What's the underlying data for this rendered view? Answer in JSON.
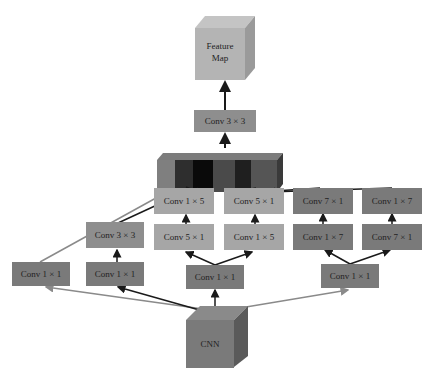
{
  "diagram": {
    "type": "network-architecture",
    "output": {
      "label_line1": "Feature",
      "label_line2": "Map"
    },
    "top_conv": {
      "label": "Conv 3 × 3"
    },
    "concat": {
      "name": "concatenation",
      "segments": 6
    },
    "input": {
      "label": "CNN"
    },
    "branches": [
      {
        "id": "b1",
        "boxes": [
          "Conv 1 × 1"
        ]
      },
      {
        "id": "b2",
        "boxes": [
          "Conv 1 × 1",
          "Conv 3 × 3"
        ]
      },
      {
        "id": "b3",
        "boxes": [
          "Conv 1 × 1",
          "Conv 5 × 1",
          "Conv 1 × 5"
        ],
        "split": [
          "Conv 5 × 1",
          "Conv 1 × 5"
        ],
        "top": [
          "Conv 1 × 5",
          "Conv 5 × 1"
        ]
      },
      {
        "id": "b4",
        "boxes": [
          "Conv 1 × 1",
          "Conv 1 × 7",
          "Conv 7 × 1"
        ],
        "split": [
          "Conv 1 × 7",
          "Conv 7 × 1"
        ],
        "top": [
          "Conv 7 × 1",
          "Conv 1 × 7"
        ]
      }
    ],
    "labels": {
      "b1_c1": "Conv 1 × 1",
      "b2_c1": "Conv 1 × 1",
      "b2_c2": "Conv 3 × 3",
      "b3_c1": "Conv 1 × 1",
      "b3_l2": "Conv 5 × 1",
      "b3_r2": "Conv 1 × 5",
      "b3_l3": "Conv 1 × 5",
      "b3_r3": "Conv 5 × 1",
      "b4_c1": "Conv 1 × 1",
      "b4_l2": "Conv 1 × 7",
      "b4_r2": "Conv 7 × 1",
      "b4_l3": "Conv 7 × 1",
      "b4_r3": "Conv 1 × 7"
    },
    "colors": {
      "box_dark": "#7a7a7a",
      "box_mid": "#8e8e8e",
      "box_light": "#a6a6a6",
      "arrow_dark": "#1a1a1a",
      "arrow_light": "#8a8a8a"
    }
  }
}
